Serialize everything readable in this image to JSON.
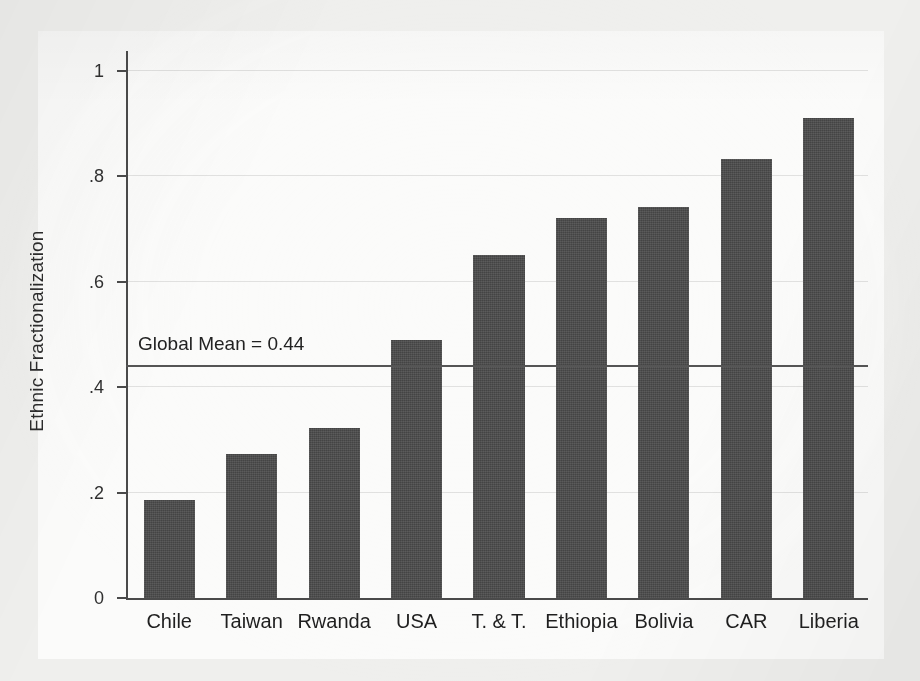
{
  "chart_data": {
    "type": "bar",
    "title": "",
    "xlabel": "",
    "ylabel": "Ethnic Fractionalization",
    "ylim": [
      0,
      1
    ],
    "grid": true,
    "legend": "none",
    "categories": [
      "Chile",
      "Taiwan",
      "Rwanda",
      "USA",
      "T. & T.",
      "Ethiopia",
      "Bolivia",
      "CAR",
      "Liberia"
    ],
    "values": [
      0.186,
      0.274,
      0.322,
      0.489,
      0.65,
      0.722,
      0.742,
      0.833,
      0.911
    ],
    "ytick_labels": [
      "0",
      ".2",
      ".4",
      ".6",
      ".8",
      "1"
    ],
    "ytick_values": [
      0,
      0.2,
      0.4,
      0.6,
      0.8,
      1
    ],
    "annotations": [
      {
        "name": "global-mean-line",
        "label": "Global Mean = 0.44",
        "value": 0.44,
        "orientation": "horizontal"
      }
    ],
    "colors": {
      "bar": "#4b4b4b",
      "axis": "#4a4a4a",
      "reference_line": "#555555",
      "plot_background": "#fbfbfa",
      "page_background": "#efefed"
    }
  }
}
